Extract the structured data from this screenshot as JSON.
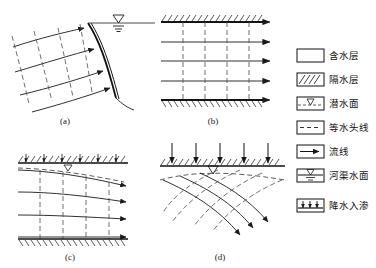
{
  "figure": {
    "title": "",
    "background_color": "#ffffff",
    "line_color": "#1a1a1a",
    "dash_color": "#4a4a4a"
  },
  "panels": [
    {
      "id": "a",
      "label": "(a)",
      "description": "Flow net near a river bank with sloping seepage face; equipotential lines dashed, flow lines with arrows toward the stream, river water surface symbol at upper right"
    },
    {
      "id": "b",
      "label": "(b)",
      "description": "Confined aquifer bounded above and below by aquicludes; horizontal parallel flow lines with arrows and vertical dashed equipotential lines"
    },
    {
      "id": "c",
      "label": "(c)",
      "description": "Unconfined aquifer with sloping water table under the upper aquiclude; horizontal flow lines with arrows and vertical dashed equipotential lines over a basal aquiclude"
    },
    {
      "id": "d",
      "label": "(d)",
      "description": "Recharge from precipitation infiltration through the ground surface; curved flow lines diverging downward crossing dashed equipotential lines, water table symbol below surface"
    }
  ],
  "legend": {
    "items": [
      {
        "key": "aquifer",
        "label": "含水层",
        "symbol": "blank-box"
      },
      {
        "key": "aquiclude",
        "label": "隔水层",
        "symbol": "hatched-box"
      },
      {
        "key": "water-table",
        "label": "潜水面",
        "symbol": "water-table-box"
      },
      {
        "key": "equipotential",
        "label": "等水头线",
        "symbol": "dashed-line-box"
      },
      {
        "key": "flow-line",
        "label": "流线",
        "symbol": "arrow-line-box"
      },
      {
        "key": "river-surface",
        "label": "河渠水面",
        "symbol": "river-surface-box"
      },
      {
        "key": "infiltration",
        "label": "降水入渗",
        "symbol": "infiltration-box"
      }
    ]
  }
}
